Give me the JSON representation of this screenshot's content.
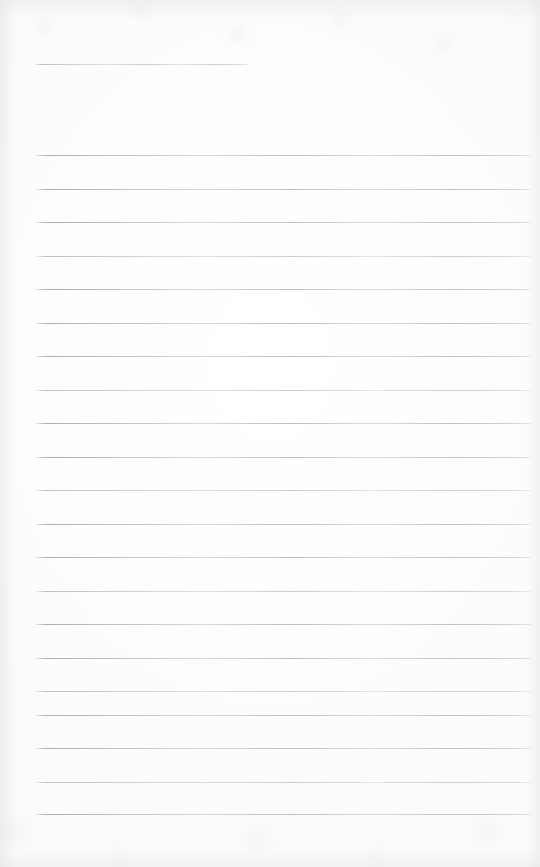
{
  "document": {
    "kind": "scanned-ruled-paper",
    "title": "Blank lined notebook page",
    "page_width": 540,
    "page_height": 867,
    "visible_text": "",
    "colors": {
      "paper": "#fdfdfd",
      "paper_edge_shadow": "#dee1e4",
      "rule_line": "#b0b4b9"
    }
  },
  "rules": {
    "count": 21,
    "left_margin_x": 36,
    "full_right_x": 531,
    "spacing_px": 33.6,
    "items": [
      {
        "id": "rule-01",
        "y": 64,
        "x": 36,
        "width": 213,
        "weight": "faded",
        "note": "short top rule"
      },
      {
        "id": "rule-02",
        "y": 155,
        "x": 36,
        "width": 495,
        "weight": "strong",
        "note": ""
      },
      {
        "id": "rule-03",
        "y": 189,
        "x": 36,
        "width": 495,
        "weight": "strong",
        "note": ""
      },
      {
        "id": "rule-04",
        "y": 222,
        "x": 36,
        "width": 495,
        "weight": "strong",
        "note": ""
      },
      {
        "id": "rule-05",
        "y": 256,
        "x": 36,
        "width": 495,
        "weight": "faded",
        "note": ""
      },
      {
        "id": "rule-06",
        "y": 289,
        "x": 36,
        "width": 495,
        "weight": "strong",
        "note": ""
      },
      {
        "id": "rule-07",
        "y": 323,
        "x": 36,
        "width": 495,
        "weight": "strong",
        "note": ""
      },
      {
        "id": "rule-08",
        "y": 356,
        "x": 36,
        "width": 495,
        "weight": "strong",
        "note": ""
      },
      {
        "id": "rule-09",
        "y": 390,
        "x": 36,
        "width": 495,
        "weight": "faded",
        "note": ""
      },
      {
        "id": "rule-10",
        "y": 423,
        "x": 36,
        "width": 495,
        "weight": "strong",
        "note": ""
      },
      {
        "id": "rule-11",
        "y": 457,
        "x": 36,
        "width": 495,
        "weight": "strong",
        "note": ""
      },
      {
        "id": "rule-12",
        "y": 490,
        "x": 36,
        "width": 495,
        "weight": "faded",
        "note": ""
      },
      {
        "id": "rule-13",
        "y": 524,
        "x": 36,
        "width": 495,
        "weight": "strong",
        "note": ""
      },
      {
        "id": "rule-14",
        "y": 557,
        "x": 36,
        "width": 495,
        "weight": "strong",
        "note": ""
      },
      {
        "id": "rule-15",
        "y": 591,
        "x": 36,
        "width": 495,
        "weight": "faded",
        "note": ""
      },
      {
        "id": "rule-16",
        "y": 624,
        "x": 36,
        "width": 495,
        "weight": "strong",
        "note": ""
      },
      {
        "id": "rule-17",
        "y": 658,
        "x": 36,
        "width": 495,
        "weight": "strong",
        "note": ""
      },
      {
        "id": "rule-18",
        "y": 691,
        "x": 36,
        "width": 495,
        "weight": "faded",
        "note": ""
      },
      {
        "id": "rule-19",
        "y": 715,
        "x": 36,
        "width": 495,
        "weight": "strong",
        "note": ""
      },
      {
        "id": "rule-20",
        "y": 748,
        "x": 36,
        "width": 495,
        "weight": "strong",
        "note": ""
      },
      {
        "id": "rule-21",
        "y": 782,
        "x": 36,
        "width": 495,
        "weight": "faded",
        "note": ""
      },
      {
        "id": "rule-22",
        "y": 814,
        "x": 36,
        "width": 495,
        "weight": "strong",
        "note": "last rule"
      }
    ]
  }
}
